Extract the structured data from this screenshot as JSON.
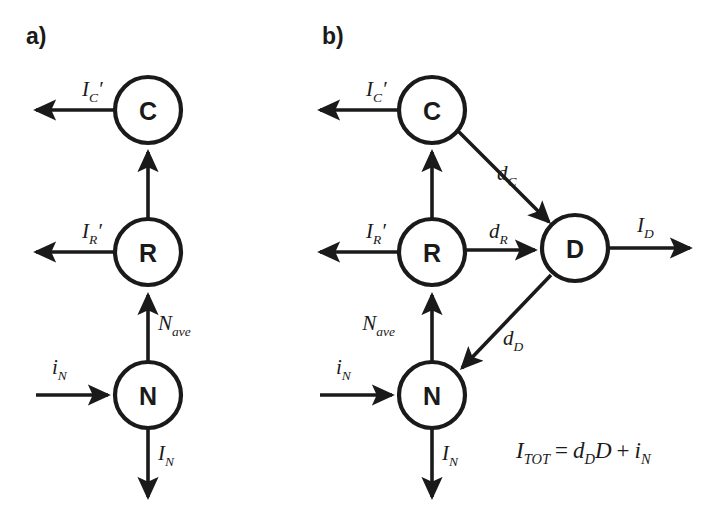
{
  "figure": {
    "background_color": "#ffffff",
    "ink_color": "#1a1a1a",
    "panels": [
      {
        "id": "panel-a",
        "label": "a)",
        "nodes": [
          {
            "id": "C",
            "label": "C",
            "cx": 148,
            "cy": 110,
            "r": 33
          },
          {
            "id": "R",
            "label": "R",
            "cx": 148,
            "cy": 252,
            "r": 33
          },
          {
            "id": "N",
            "label": "N",
            "cx": 148,
            "cy": 395,
            "r": 33
          }
        ],
        "edges": [
          {
            "id": "a-C-out",
            "label_main": "I",
            "label_prime": "′",
            "label_sub": "C",
            "label_x": 82,
            "label_y": 96
          },
          {
            "id": "a-R-to-C",
            "label_main": "",
            "label_prime": "",
            "label_sub": "",
            "label_x": 0,
            "label_y": 0
          },
          {
            "id": "a-R-out",
            "label_main": "I",
            "label_prime": "′",
            "label_sub": "R",
            "label_x": 82,
            "label_y": 238
          },
          {
            "id": "a-N-to-R",
            "label_main": "N",
            "label_prime": "",
            "label_sub": "ave",
            "label_x": 158,
            "label_y": 330
          },
          {
            "id": "a-in-N",
            "label_main": "i",
            "label_prime": "",
            "label_sub": "N",
            "label_x": 52,
            "label_y": 374
          },
          {
            "id": "a-N-out",
            "label_main": "I",
            "label_prime": "",
            "label_sub": "N",
            "label_x": 158,
            "label_y": 460
          }
        ]
      },
      {
        "id": "panel-b",
        "label": "b)",
        "nodes": [
          {
            "id": "C",
            "label": "C",
            "cx": 432,
            "cy": 110,
            "r": 33
          },
          {
            "id": "R",
            "label": "R",
            "cx": 432,
            "cy": 252,
            "r": 33
          },
          {
            "id": "N",
            "label": "N",
            "cx": 432,
            "cy": 395,
            "r": 33
          },
          {
            "id": "D",
            "label": "D",
            "cx": 575,
            "cy": 248,
            "r": 33
          }
        ],
        "edges": [
          {
            "id": "b-C-out",
            "label_main": "I",
            "label_prime": "′",
            "label_sub": "C",
            "label_x": 366,
            "label_y": 96
          },
          {
            "id": "b-R-to-C",
            "label_main": "",
            "label_prime": "",
            "label_sub": "",
            "label_x": 0,
            "label_y": 0
          },
          {
            "id": "b-R-out",
            "label_main": "I",
            "label_prime": "′",
            "label_sub": "R",
            "label_x": 366,
            "label_y": 238
          },
          {
            "id": "b-N-to-R",
            "label_main": "N",
            "label_prime": "",
            "label_sub": "ave",
            "label_x": 395,
            "label_y": 330
          },
          {
            "id": "b-in-N",
            "label_main": "i",
            "label_prime": "",
            "label_sub": "N",
            "label_x": 336,
            "label_y": 374
          },
          {
            "id": "b-N-out",
            "label_main": "I",
            "label_prime": "",
            "label_sub": "N",
            "label_x": 442,
            "label_y": 460
          },
          {
            "id": "b-C-to-D",
            "label_main": "d",
            "label_prime": "",
            "label_sub": "C",
            "label_x": 497,
            "label_y": 180
          },
          {
            "id": "b-R-to-D",
            "label_main": "d",
            "label_prime": "",
            "label_sub": "R",
            "label_x": 489,
            "label_y": 238
          },
          {
            "id": "b-D-to-N",
            "label_main": "d",
            "label_prime": "",
            "label_sub": "D",
            "label_x": 503,
            "label_y": 345
          },
          {
            "id": "b-D-out",
            "label_main": "I",
            "label_prime": "",
            "label_sub": "D",
            "label_x": 637,
            "label_y": 232
          }
        ],
        "equation": {
          "lhs_main": "I",
          "lhs_sub": "TOT",
          "eq": "=",
          "t1_main": "d",
          "t1_sub": "D",
          "t1_factor": "D",
          "plus": "+",
          "t2_main": "i",
          "t2_sub": "N",
          "x": 516,
          "y": 458
        }
      }
    ]
  }
}
